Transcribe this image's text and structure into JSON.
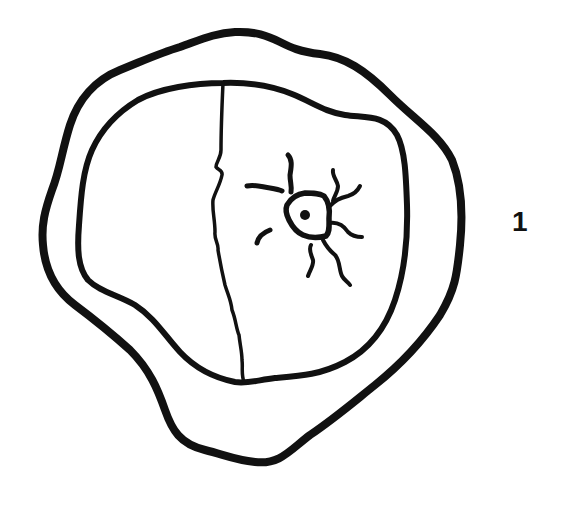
{
  "figure": {
    "label": "1",
    "colors": {
      "ink": "#111111",
      "background": "#ffffff"
    },
    "parts": [
      {
        "name": "outer-wall",
        "description": "thick irregular outer contour"
      },
      {
        "name": "inner-body",
        "description": "inner irregular contour"
      },
      {
        "name": "division-line",
        "description": "wavy vertical line dividing inner body"
      },
      {
        "name": "radiate-structure",
        "description": "small polygon with central dot and radiating wavy strands"
      }
    ]
  }
}
